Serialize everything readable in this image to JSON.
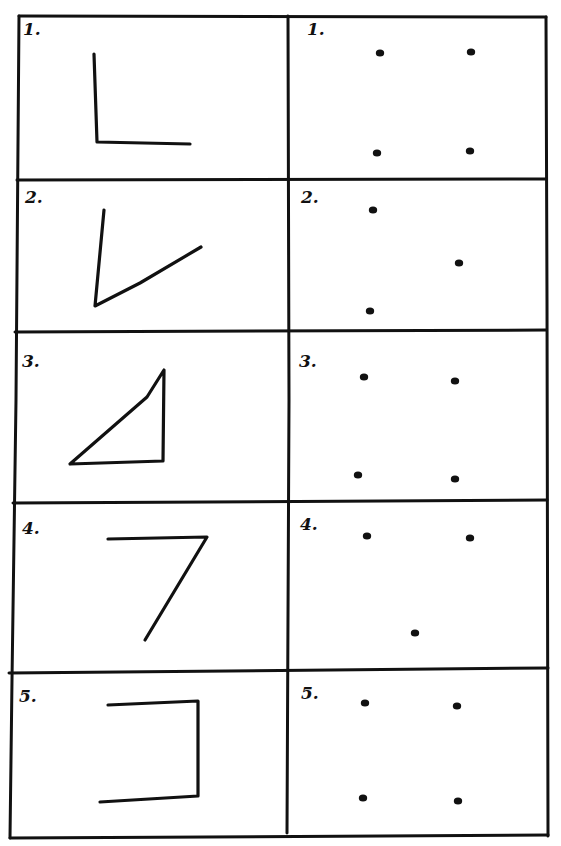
{
  "worksheet": {
    "columns": [
      {
        "name": "figures",
        "description": "hand-drawn stroke figures"
      },
      {
        "name": "dot-patterns",
        "description": "dot patterns matching figure vertices"
      }
    ],
    "rows": [
      {
        "number": 1,
        "figure_label": "1.",
        "figure_shape": "L-shape (vertical line with horizontal base to the right)",
        "figure_strokes": [
          [
            [
              94,
              54
            ],
            [
              97,
              142
            ],
            [
              190,
              144
            ]
          ]
        ],
        "dots_label": "1.",
        "dots": [
          [
            380,
            53
          ],
          [
            471,
            52
          ],
          [
            377,
            153
          ],
          [
            470,
            151
          ]
        ]
      },
      {
        "number": 2,
        "figure_label": "2.",
        "figure_shape": "V-shape (open angle)",
        "figure_strokes": [
          [
            [
              104,
              210
            ],
            [
              95,
              306
            ],
            [
              140,
              283
            ],
            [
              201,
              247
            ]
          ]
        ],
        "dots_label": "2.",
        "dots": [
          [
            373,
            210
          ],
          [
            459,
            263
          ],
          [
            370,
            311
          ]
        ]
      },
      {
        "number": 3,
        "figure_label": "3.",
        "figure_shape": "right triangle",
        "figure_strokes": [
          [
            [
              70,
              464
            ],
            [
              147,
              397
            ],
            [
              164,
              370
            ],
            [
              163,
              461
            ],
            [
              70,
              464
            ]
          ]
        ],
        "dots_label": "3.",
        "dots": [
          [
            364,
            377
          ],
          [
            455,
            381
          ],
          [
            358,
            475
          ],
          [
            455,
            479
          ]
        ]
      },
      {
        "number": 4,
        "figure_label": "4.",
        "figure_shape": "7-shape (horizontal top with diagonal stroke)",
        "figure_strokes": [
          [
            [
              108,
              539
            ],
            [
              207,
              537
            ],
            [
              145,
              640
            ]
          ]
        ],
        "dots_label": "4.",
        "dots": [
          [
            367,
            536
          ],
          [
            470,
            538
          ],
          [
            415,
            633
          ]
        ]
      },
      {
        "number": 5,
        "figure_label": "5.",
        "figure_shape": "bracket shape (open on the left)",
        "figure_strokes": [
          [
            [
              108,
              705
            ],
            [
              198,
              701
            ],
            [
              198,
              796
            ],
            [
              100,
              802
            ]
          ]
        ],
        "dots_label": "5.",
        "dots": [
          [
            365,
            703
          ],
          [
            457,
            706
          ],
          [
            363,
            798
          ],
          [
            458,
            801
          ]
        ]
      }
    ]
  },
  "style": {
    "ink_color": "#111111",
    "paper_color": "#ffffff"
  }
}
